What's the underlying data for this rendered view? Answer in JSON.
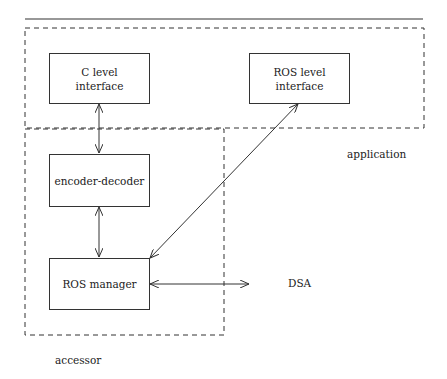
{
  "diagram": {
    "regions": {
      "application": "application",
      "accessor": "accessor"
    },
    "nodes": {
      "c_level": {
        "line1": "C level",
        "line2": "interface"
      },
      "ros_level": {
        "line1": "ROS level",
        "line2": "interface"
      },
      "encoder": {
        "label": "encoder-decoder"
      },
      "ros_manager": {
        "label": "ROS manager"
      },
      "dsa": {
        "label": "DSA"
      }
    },
    "edges": [
      {
        "from": "c_level",
        "to": "encoder",
        "type": "bidirectional"
      },
      {
        "from": "encoder",
        "to": "ros_manager",
        "type": "bidirectional"
      },
      {
        "from": "ros_manager",
        "to": "ros_level",
        "type": "bidirectional"
      },
      {
        "from": "ros_manager",
        "to": "dsa",
        "type": "bidirectional"
      }
    ]
  }
}
